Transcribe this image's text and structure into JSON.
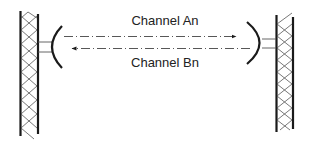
{
  "diagram": {
    "type": "microwave-link",
    "colors": {
      "line": "#1a1a1a",
      "lattice": "#555555",
      "dash": "#444444",
      "text": "#222222",
      "background": "#ffffff"
    },
    "channels": [
      {
        "label": "Channel An",
        "direction": "left-to-right"
      },
      {
        "label": "Channel Bn",
        "direction": "right-to-left"
      }
    ],
    "towers": [
      {
        "name": "left-tower",
        "antenna_facing": "right"
      },
      {
        "name": "right-tower",
        "antenna_facing": "left"
      }
    ]
  }
}
